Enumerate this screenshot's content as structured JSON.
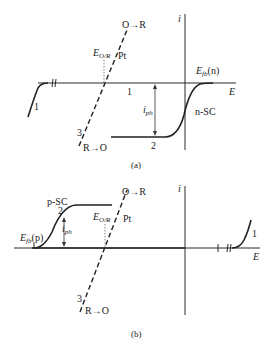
{
  "panel_a": {
    "caption": "(a)",
    "axis_i_label": "i",
    "axis_e_label": "E",
    "efb_label": "E",
    "efb_sub": "fb",
    "efb_suffix": "(n)",
    "eor_label": "E",
    "eor_sub": "O/R",
    "pt_label": "Pt",
    "o_to_r": "O→R",
    "r_to_o": "R→O",
    "curve1_label": "1",
    "curve1_label_mid": "1",
    "curve2_label": "2",
    "curve3_label": "3",
    "iph_label": "i",
    "iph_sub": "ph",
    "sc_label": "n-SC"
  },
  "panel_b": {
    "caption": "(b)",
    "axis_i_label": "i",
    "axis_e_label": "E",
    "efb_label": "E",
    "efb_sub": "fb",
    "efb_suffix": "(p)",
    "eor_label": "E",
    "eor_sub": "O/R",
    "pt_label": "Pt",
    "o_to_r": "O→R",
    "r_to_o": "R→O",
    "curve1_label": "1",
    "curve2_label": "2",
    "curve3_label": "3",
    "iph_label": "i",
    "iph_sub": "ph",
    "sc_label": "p-SC"
  }
}
